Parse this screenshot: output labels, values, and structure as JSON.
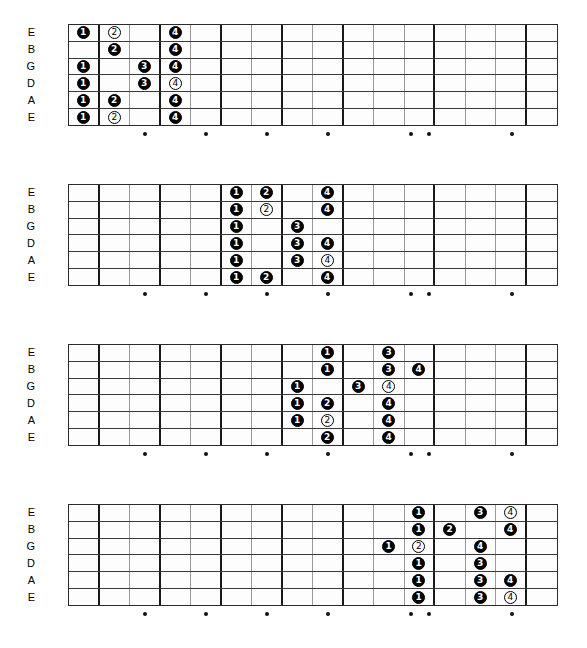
{
  "meta": {
    "num_frets": 16,
    "num_strings": 6,
    "colors": {
      "marker_filled_bg": "#000000",
      "marker_filled_text": "#ffffff",
      "marker_open_bg": "#ffffff",
      "marker_open_text": "#000000",
      "board_border": "#2b2b2b",
      "fret_line": "#9a9a9a",
      "fret_line_thick": "#1a1a1a",
      "inlay_dot": "#111111",
      "background": "#ffffff"
    }
  },
  "string_labels": [
    "E",
    "B",
    "G",
    "D",
    "A",
    "E"
  ],
  "inlay_frets": [
    3,
    5,
    7,
    9,
    12,
    12,
    15
  ],
  "inlay_positions": [
    3,
    5,
    7,
    9,
    11.7,
    12.3,
    15
  ],
  "thick_fret_lines": [
    1,
    3,
    5,
    7,
    9,
    12,
    15
  ],
  "diagrams": [
    {
      "name": "position-1",
      "top": 24,
      "markers": [
        {
          "string": 0,
          "fret": 1,
          "finger": "1",
          "style": "filled"
        },
        {
          "string": 0,
          "fret": 2,
          "finger": "2",
          "style": "open"
        },
        {
          "string": 0,
          "fret": 4,
          "finger": "4",
          "style": "filled"
        },
        {
          "string": 1,
          "fret": 2,
          "finger": "2",
          "style": "filled"
        },
        {
          "string": 1,
          "fret": 4,
          "finger": "4",
          "style": "filled"
        },
        {
          "string": 2,
          "fret": 1,
          "finger": "1",
          "style": "filled"
        },
        {
          "string": 2,
          "fret": 3,
          "finger": "3",
          "style": "filled"
        },
        {
          "string": 2,
          "fret": 4,
          "finger": "4",
          "style": "filled"
        },
        {
          "string": 3,
          "fret": 1,
          "finger": "1",
          "style": "filled"
        },
        {
          "string": 3,
          "fret": 3,
          "finger": "3",
          "style": "filled"
        },
        {
          "string": 3,
          "fret": 4,
          "finger": "4",
          "style": "open"
        },
        {
          "string": 4,
          "fret": 1,
          "finger": "1",
          "style": "filled"
        },
        {
          "string": 4,
          "fret": 2,
          "finger": "2",
          "style": "filled"
        },
        {
          "string": 4,
          "fret": 4,
          "finger": "4",
          "style": "filled"
        },
        {
          "string": 5,
          "fret": 1,
          "finger": "1",
          "style": "filled"
        },
        {
          "string": 5,
          "fret": 2,
          "finger": "2",
          "style": "open"
        },
        {
          "string": 5,
          "fret": 4,
          "finger": "4",
          "style": "filled"
        }
      ]
    },
    {
      "name": "position-2",
      "top": 184,
      "markers": [
        {
          "string": 0,
          "fret": 6,
          "finger": "1",
          "style": "filled"
        },
        {
          "string": 0,
          "fret": 7,
          "finger": "2",
          "style": "filled"
        },
        {
          "string": 0,
          "fret": 9,
          "finger": "4",
          "style": "filled"
        },
        {
          "string": 1,
          "fret": 6,
          "finger": "1",
          "style": "filled"
        },
        {
          "string": 1,
          "fret": 7,
          "finger": "2",
          "style": "open"
        },
        {
          "string": 1,
          "fret": 9,
          "finger": "4",
          "style": "filled"
        },
        {
          "string": 2,
          "fret": 6,
          "finger": "1",
          "style": "filled"
        },
        {
          "string": 2,
          "fret": 8,
          "finger": "3",
          "style": "filled"
        },
        {
          "string": 3,
          "fret": 6,
          "finger": "1",
          "style": "filled"
        },
        {
          "string": 3,
          "fret": 8,
          "finger": "3",
          "style": "filled"
        },
        {
          "string": 3,
          "fret": 9,
          "finger": "4",
          "style": "filled"
        },
        {
          "string": 4,
          "fret": 6,
          "finger": "1",
          "style": "filled"
        },
        {
          "string": 4,
          "fret": 8,
          "finger": "3",
          "style": "filled"
        },
        {
          "string": 4,
          "fret": 9,
          "finger": "4",
          "style": "open"
        },
        {
          "string": 5,
          "fret": 6,
          "finger": "1",
          "style": "filled"
        },
        {
          "string": 5,
          "fret": 7,
          "finger": "2",
          "style": "filled"
        },
        {
          "string": 5,
          "fret": 9,
          "finger": "4",
          "style": "filled"
        }
      ]
    },
    {
      "name": "position-3",
      "top": 344,
      "markers": [
        {
          "string": 0,
          "fret": 9,
          "finger": "1",
          "style": "filled"
        },
        {
          "string": 0,
          "fret": 11,
          "finger": "3",
          "style": "filled"
        },
        {
          "string": 1,
          "fret": 9,
          "finger": "1",
          "style": "filled"
        },
        {
          "string": 1,
          "fret": 11,
          "finger": "3",
          "style": "filled"
        },
        {
          "string": 1,
          "fret": 12,
          "finger": "4",
          "style": "filled"
        },
        {
          "string": 2,
          "fret": 8,
          "finger": "1",
          "style": "filled"
        },
        {
          "string": 2,
          "fret": 10,
          "finger": "3",
          "style": "filled"
        },
        {
          "string": 2,
          "fret": 11,
          "finger": "4",
          "style": "open"
        },
        {
          "string": 3,
          "fret": 8,
          "finger": "1",
          "style": "filled"
        },
        {
          "string": 3,
          "fret": 9,
          "finger": "2",
          "style": "filled"
        },
        {
          "string": 3,
          "fret": 11,
          "finger": "4",
          "style": "filled"
        },
        {
          "string": 4,
          "fret": 8,
          "finger": "1",
          "style": "filled"
        },
        {
          "string": 4,
          "fret": 9,
          "finger": "2",
          "style": "open"
        },
        {
          "string": 4,
          "fret": 11,
          "finger": "4",
          "style": "filled"
        },
        {
          "string": 5,
          "fret": 9,
          "finger": "2",
          "style": "filled"
        },
        {
          "string": 5,
          "fret": 11,
          "finger": "4",
          "style": "filled"
        }
      ]
    },
    {
      "name": "position-4",
      "top": 504,
      "markers": [
        {
          "string": 0,
          "fret": 12,
          "finger": "1",
          "style": "filled"
        },
        {
          "string": 0,
          "fret": 14,
          "finger": "3",
          "style": "filled"
        },
        {
          "string": 0,
          "fret": 15,
          "finger": "4",
          "style": "open"
        },
        {
          "string": 1,
          "fret": 12,
          "finger": "1",
          "style": "filled"
        },
        {
          "string": 1,
          "fret": 13,
          "finger": "2",
          "style": "filled"
        },
        {
          "string": 1,
          "fret": 15,
          "finger": "4",
          "style": "filled"
        },
        {
          "string": 2,
          "fret": 11,
          "finger": "1",
          "style": "filled"
        },
        {
          "string": 2,
          "fret": 12,
          "finger": "2",
          "style": "open"
        },
        {
          "string": 2,
          "fret": 14,
          "finger": "4",
          "style": "filled"
        },
        {
          "string": 3,
          "fret": 12,
          "finger": "1",
          "style": "filled"
        },
        {
          "string": 3,
          "fret": 14,
          "finger": "3",
          "style": "filled"
        },
        {
          "string": 4,
          "fret": 12,
          "finger": "1",
          "style": "filled"
        },
        {
          "string": 4,
          "fret": 14,
          "finger": "3",
          "style": "filled"
        },
        {
          "string": 4,
          "fret": 15,
          "finger": "4",
          "style": "filled"
        },
        {
          "string": 5,
          "fret": 12,
          "finger": "1",
          "style": "filled"
        },
        {
          "string": 5,
          "fret": 14,
          "finger": "3",
          "style": "filled"
        },
        {
          "string": 5,
          "fret": 15,
          "finger": "4",
          "style": "open"
        }
      ]
    }
  ]
}
